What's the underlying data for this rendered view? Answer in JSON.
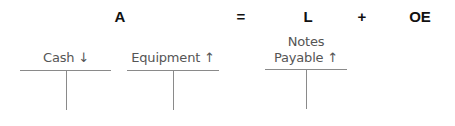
{
  "equation": {
    "assets": "A",
    "equals": "=",
    "liabilities": "L",
    "plus": "+",
    "owners_equity": "OE"
  },
  "t_accounts": [
    {
      "name": "Cash",
      "direction_arrow": "↓",
      "label": "Cash ↓"
    },
    {
      "name": "Equipment",
      "direction_arrow": "↑",
      "label": "Equipment ↑"
    },
    {
      "name": "Notes Payable",
      "direction_arrow": "↑",
      "label_line1": "Notes",
      "label_line2": "Payable ↑"
    }
  ]
}
